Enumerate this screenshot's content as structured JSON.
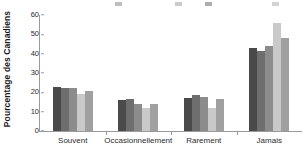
{
  "chart_data": {
    "type": "bar",
    "title": "",
    "xlabel": "",
    "ylabel": "Pourcentage des Canadiens",
    "ylim": [
      0,
      60
    ],
    "yticks": [
      0,
      10,
      20,
      30,
      40,
      50,
      60
    ],
    "grid": false,
    "legend_position": "top",
    "categories": [
      "Souvent",
      "Occasionnellement",
      "Rarement",
      "Jamais"
    ],
    "series": [
      {
        "name": "Serie 1",
        "color": "#4a4a4a",
        "values": [
          23,
          16,
          17,
          43
        ]
      },
      {
        "name": "Serie 2",
        "color": "#6e6e6e",
        "values": [
          22.5,
          16.5,
          18.5,
          41.5
        ]
      },
      {
        "name": "Serie 3",
        "color": "#8c8c8c",
        "values": [
          22,
          14,
          17.5,
          44
        ]
      },
      {
        "name": "Serie 4",
        "color": "#c9c9c9",
        "values": [
          19,
          12,
          12,
          56
        ]
      },
      {
        "name": "Serie 5",
        "color": "#a0a0a0",
        "values": [
          20.5,
          14,
          16.5,
          48
        ]
      }
    ]
  },
  "legend_clipped": [
    {
      "label": "",
      "color": "#6e6e6e"
    },
    {
      "label": "",
      "color": "#8c8c8c"
    },
    {
      "label": "",
      "color": "#4a4a4a"
    },
    {
      "label": "",
      "color": "#a0a0a0"
    }
  ]
}
